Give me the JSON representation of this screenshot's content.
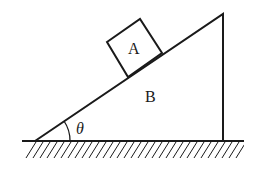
{
  "diagram": {
    "type": "inclined-plane",
    "labels": {
      "block": "A",
      "wedge": "B",
      "angle": "θ"
    },
    "colors": {
      "stroke": "#1a1a1a",
      "background": "#ffffff"
    }
  }
}
